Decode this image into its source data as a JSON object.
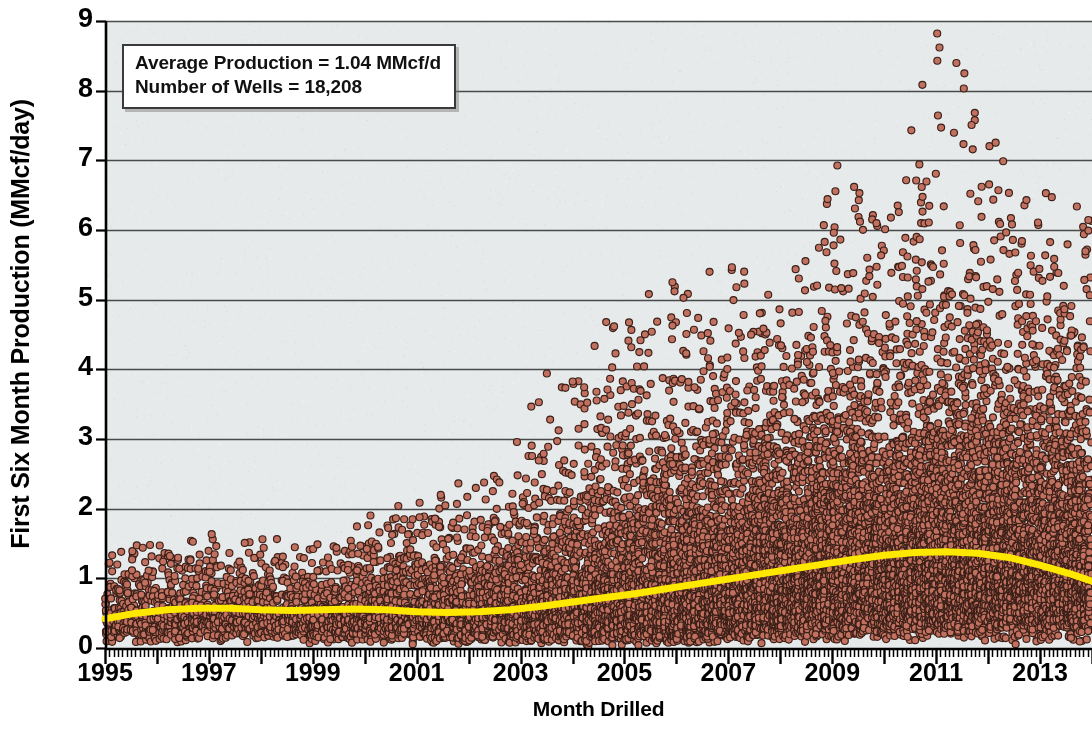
{
  "chart_data": {
    "type": "scatter",
    "title": "",
    "xlabel": "Month Drilled",
    "ylabel": "First Six Month Production (MMcf/day)",
    "xlim": [
      1995.0,
      2014.0
    ],
    "ylim": [
      0,
      9
    ],
    "grid": true,
    "legend_position": "none",
    "y_ticks": [
      0,
      1,
      2,
      3,
      4,
      5,
      6,
      7,
      8,
      9
    ],
    "y_tick_labels": [
      "0",
      "1",
      "2",
      "3",
      "4",
      "5",
      "6",
      "7",
      "8",
      "9"
    ],
    "x_ticks": [
      1995,
      1997,
      1999,
      2001,
      2003,
      2005,
      2007,
      2009,
      2011,
      2013
    ],
    "x_tick_labels": [
      "1995",
      "1997",
      "1999",
      "2001",
      "2003",
      "2005",
      "2007",
      "2009",
      "2011",
      "2013"
    ],
    "x_minor_tick_interval_months": 1,
    "series": [
      {
        "name": "Well first six month production",
        "type": "scatter",
        "marker": "circle",
        "marker_size_px": 7,
        "fill_color": "#c2705f",
        "edge_color": "#3a2018",
        "point_count": 18208,
        "description": "One point per gas well, plotted at its month drilled versus first six month average production in MMcf/day. Density and upper spread increase strongly after 2003 and peak near 2011.",
        "monthly_profile": [
          {
            "year": 1995,
            "wells_per_month": 22,
            "median": 0.42,
            "p90": 0.95,
            "max": 1.35
          },
          {
            "year": 1996,
            "wells_per_month": 24,
            "median": 0.48,
            "p90": 1.05,
            "max": 1.5
          },
          {
            "year": 1997,
            "wells_per_month": 26,
            "median": 0.5,
            "p90": 1.05,
            "max": 1.55
          },
          {
            "year": 1998,
            "wells_per_month": 26,
            "median": 0.48,
            "p90": 1.0,
            "max": 1.45
          },
          {
            "year": 1999,
            "wells_per_month": 26,
            "median": 0.46,
            "p90": 1.0,
            "max": 1.55
          },
          {
            "year": 2000,
            "wells_per_month": 34,
            "median": 0.5,
            "p90": 1.2,
            "max": 1.75
          },
          {
            "year": 2001,
            "wells_per_month": 40,
            "median": 0.52,
            "p90": 1.25,
            "max": 2.0
          },
          {
            "year": 2002,
            "wells_per_month": 44,
            "median": 0.55,
            "p90": 1.35,
            "max": 2.4
          },
          {
            "year": 2003,
            "wells_per_month": 60,
            "median": 0.6,
            "p90": 1.6,
            "max": 3.1
          },
          {
            "year": 2004,
            "wells_per_month": 78,
            "median": 0.66,
            "p90": 1.85,
            "max": 4.2
          },
          {
            "year": 2005,
            "wells_per_month": 95,
            "median": 0.74,
            "p90": 2.1,
            "max": 4.7
          },
          {
            "year": 2006,
            "wells_per_month": 110,
            "median": 0.82,
            "p90": 2.35,
            "max": 5.3
          },
          {
            "year": 2007,
            "wells_per_month": 120,
            "median": 0.92,
            "p90": 2.55,
            "max": 5.1
          },
          {
            "year": 2008,
            "wells_per_month": 130,
            "median": 1.02,
            "p90": 2.75,
            "max": 5.0
          },
          {
            "year": 2009,
            "wells_per_month": 125,
            "median": 1.12,
            "p90": 2.95,
            "max": 6.85
          },
          {
            "year": 2010,
            "wells_per_month": 140,
            "median": 1.24,
            "p90": 3.2,
            "max": 5.6
          },
          {
            "year": 2011,
            "wells_per_month": 150,
            "median": 1.32,
            "p90": 3.35,
            "max": 8.65
          },
          {
            "year": 2012,
            "wells_per_month": 145,
            "median": 1.3,
            "p90": 3.3,
            "max": 6.8
          },
          {
            "year": 2013,
            "wells_per_month": 135,
            "median": 1.18,
            "p90": 3.2,
            "max": 6.05
          }
        ]
      },
      {
        "name": "Average trend line",
        "type": "line",
        "line_color": "#ffe800",
        "line_width_px": 7,
        "x": [
          1995.0,
          1995.6,
          1996.2,
          1996.8,
          1997.4,
          1998.0,
          1998.6,
          1999.2,
          1999.8,
          2000.4,
          2001.0,
          2001.6,
          2002.2,
          2002.8,
          2003.4,
          2004.0,
          2004.6,
          2005.2,
          2005.8,
          2006.4,
          2007.0,
          2007.6,
          2008.2,
          2008.8,
          2009.4,
          2010.0,
          2010.6,
          2011.2,
          2011.8,
          2012.4,
          2013.0,
          2013.6,
          2014.0
        ],
        "y": [
          0.42,
          0.5,
          0.55,
          0.57,
          0.57,
          0.55,
          0.54,
          0.55,
          0.56,
          0.55,
          0.52,
          0.51,
          0.52,
          0.55,
          0.6,
          0.66,
          0.72,
          0.78,
          0.85,
          0.92,
          0.99,
          1.06,
          1.13,
          1.2,
          1.27,
          1.33,
          1.37,
          1.38,
          1.36,
          1.3,
          1.19,
          1.06,
          0.96
        ]
      }
    ],
    "annotations": [
      {
        "id": "summary-box",
        "lines": [
          "Average Production = 1.04 MMcf/d",
          "Number of Wells = 18,208"
        ],
        "average_production_mmcfd": 1.04,
        "number_of_wells": 18208
      }
    ],
    "colors": {
      "plot_background": "#e6eaea",
      "figure_background": "#ffffff",
      "gridline": "#4a4a4a",
      "axis": "#000000",
      "marker_fill": "#c2705f",
      "marker_edge": "#3a2018",
      "trend_line": "#ffe800",
      "text": "#000000"
    },
    "geometry": {
      "plot_left_px": 105,
      "plot_right_px": 1092,
      "plot_top_px": 21,
      "plot_bottom_px": 648
    }
  }
}
